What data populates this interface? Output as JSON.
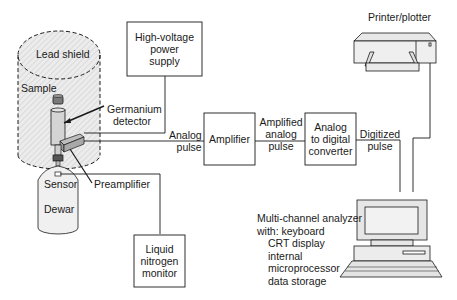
{
  "diagram": {
    "colors": {
      "line": "#1a1a1a",
      "shield_fill": "#e6e6e6",
      "component_fill": "#d9d9d9",
      "dark_fill": "#8a8a8a"
    },
    "labels": {
      "lead_shield": "Lead shield",
      "sample": "Sample",
      "germanium_detector_1": "Germanium",
      "germanium_detector_2": "detector",
      "sensor": "Sensor",
      "dewar": "Dewar",
      "preamplifier": "Preamplifier",
      "analog_pulse_1": "Analog",
      "analog_pulse_2": "pulse",
      "amplified_pulse_1": "Amplified",
      "amplified_pulse_2": "analog",
      "amplified_pulse_3": "pulse",
      "digitized_pulse_1": "Digitized",
      "digitized_pulse_2": "pulse",
      "printer": "Printer/plotter"
    },
    "boxes": {
      "hv_supply": [
        "High-voltage",
        "power",
        "supply"
      ],
      "amplifier": [
        "Amplifier"
      ],
      "adc": [
        "Analog",
        "to digital",
        "converter"
      ],
      "ln2_monitor": [
        "Liquid",
        "nitrogen",
        "monitor"
      ]
    },
    "analyzer": {
      "line1": "Multi-channel analyzer",
      "line2": "with: keyboard",
      "items": [
        "CRT display",
        "internal",
        "microprocessor",
        "data storage"
      ]
    }
  }
}
